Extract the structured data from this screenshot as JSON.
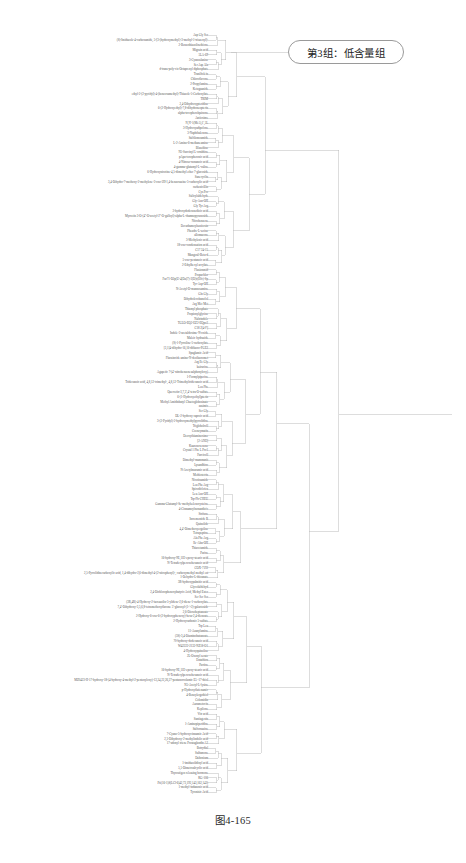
{
  "figure": {
    "caption": "图4-165",
    "background_color": "#ffffff",
    "line_color": "#b4b4b4",
    "label_color": "#545454"
  },
  "callout": {
    "label": "第3组：低含量组",
    "border_color": "#9a9a9a",
    "text_color": "#1c1c1c"
  },
  "chart_data": {
    "type": "dendrogram",
    "title": "图4-165",
    "orientation": "left-to-right",
    "leaf_label_position": "left",
    "grid": false,
    "legend": null,
    "xlabel": "",
    "ylabel": "",
    "annotations": [
      {
        "text": "第3组：低含量组",
        "target": "cluster-3",
        "shape": "rounded-rect"
      }
    ],
    "n_leaves": 170,
    "leaf_labels": [
      "Asp Gly Ser",
      "(S)-Imidazole-4-carboxamide, 5-[3-(hydroxymethyl)-3-methyl-1-triazenyl]-",
      "2-Benzothiazolinethione",
      "Migrain acid",
      "5LA-69",
      "3-Cyanoalanine",
      "Ser Asp Ala",
      "d-trans-poly-cis-Octaprenyl diphosphate",
      "Tranilfolein",
      "Chloroflavone",
      "2-Propylamine",
      "Ketoguanide",
      "ethyl-2-(2-pyridyl)-4-(benzoxamethyl)-Thiazole-5-Carboxylate",
      "TRIM",
      "2,4-Dihydroxypteridine",
      "6-(2-Hydroxyethyl)-7,8-dihydroneopterin",
      "alpha-tocopherolquinone",
      "Antioxime",
      "N,N'-1(Me5),1',5L",
      "3-Hydroxyadipolone",
      "3-Naphthalenone",
      "Sulfilomoamide",
      "L-2-Amino-6-methaneamine",
      "Blasoltine",
      "N5-Succinyl L-ornithine",
      "pApa-tocopheronic acid",
      "4-Nitroso-nonanoic acid",
      "4-gamma-glutamyl-L-valine",
      "6-Hydroxynicotine-4,5-dimethyl ether 7-glucoside",
      "Sanecyclin",
      "3,4-Dihydro-7-methoxy-2-methylene-3-oxo-2H-1,4-benzoxazine-5-carboxylic acid",
      "carbenicillin",
      "Cys Pro",
      "Salicylaldehyde",
      "Gly-Asn-OH",
      "Gly Tyr Arg",
      "3-hydroxydodecanedioic acid",
      "Myrcetin 3-O-(4''-O-acetyl-2''-O-galloyl)-alpha-L-rhamnopyranoside",
      "Nitrobenzene",
      "Decarbamoylsaxitoxin",
      "Pheadre-L-serine",
      "allomazone",
      "3-Methylenic acid",
      "18-oxo-condensation acid",
      "C17 24-15",
      "Mangosil-Beta-d",
      "5-oxo-pentanoic acid",
      "2-Ethylhexyl acrylate",
      "Flusionmid",
      "Propachlor",
      "Fur71-D2p(U-4[Da]7)-3[D]r(E0c)-Sp",
      "Tyr-Asp-OH",
      "N-Acetyl-D-mannosamine",
      "Gln Gly",
      "Dihydrolevobunolol",
      "Arg Met Met",
      "Thiamyl phosphate",
      "Propionylglycine",
      "Naltrindole",
      "TGLO-EQ2-EZ2-EQpo2",
      "C18 2[4-F]",
      "Indole-3-acetaldoxime-N-oxide",
      "Maleic hydrazide",
      "(S)-1-Pyrroline-5-carboxylate",
      "[3,1]4-dihydro-16,16-difluoro-PGE2",
      "Spaglumic Acid",
      "Flucaincide amino-N-desfluoromet",
      "Arg Ile Gly",
      "kairucine",
      "Agapetic 7-(4'-nitrobenzenesulphonyloxy)",
      "1-Formylpiperine",
      "Tridecanoic acid, 4,8,12-trimethyl-, 4,8,12-Trimethyltridecanoic acid",
      "Leu Phe",
      "Quercetin-3,7,3',4'-tetra-O-sulfate",
      "6-(1-Hydroxyethyl)pterin",
      "Methyl Amidinbutyl Chaetoglobosinate",
      "zusimic",
      "Ser Gly",
      "DL-2-hydroxy caproic acid",
      "3-(2-Pyridyl)-2-hydroxymethylpyrrolidine",
      "Trigloholroll",
      "Coenzymatin",
      "Deoxythiaminoxime",
      "[2-ANE]",
      "Kaurenoxenone",
      "Crystal 1 Phe L Pro1",
      "Furcicoll",
      "Dimethyl-mammanit",
      "Lysandhinc",
      "N-Acetylmuramic acid",
      "Methiotetrin",
      "Nicotinamide",
      "Leu Phe Arg",
      "Spirodiclofen",
      "Leu Asn-OH",
      "Trp-Ph-CHEU",
      "Gamma-Glutamyl-Se-methylselenocysteine",
      "4-Cinnamoylnonandioic",
      "Strifane",
      "Incrementide B",
      "Quinolide",
      "4,4'-Dimethoxyergoline",
      "Tetrapeptine",
      "Ala Phe Arg",
      "Ile-Abu-OH",
      "Thiacetamide",
      "Parine",
      "16-hydroxy-9E,11E-epoxy-stearic acid",
      "N-Tetradecylperoxohexanoic acid",
      "COX-7192",
      "2,5-Pyrrolidinecarboxylic acid, 1,4-dihydro-2,6-dimethyl-4-(2-nitrophenyl)-, carboxymethyl methyl est",
      "1-Dehydro-L-thioanate",
      "3R-hydroxypalmitic acid",
      "Glycolaldehyd",
      "2,4-Dichlorophenoxybutyric Acid, Methyl Ester",
      "Ser Ser Ser",
      "(3R,4R)-4-Hydroxy-2-isoxazolin-5-ylidene-2,6-diene-1-carboxylate",
      "7,4'-Dihydroxy-3,5,6,8-tetramethoxyflavone 5'-glucosyl-(1->2)-galactoside",
      "2,6-Dioxoheptanoate",
      "2-Hydroxy-6-oxo-6-(2-hydroxyphenoxy)-hexa-2,4-dienoate",
      "2-Hydroxycarbonic 5-sulfate",
      "Trp Leu",
      "11-Azanylamine",
      "(3S)-3,4-Diaminobutanoate",
      "70-hydroxy-dodecanoic acid",
      "W42222-2132-NZ18-O1",
      "4-Hydroxyquinoline",
      "2L-Oxonyl serate",
      "Entathion",
      "Pactine",
      "16-hydroxy-9E,11E-epoxy-stearic acid",
      "N-Tetradecylperoxohexanoic acid",
      "MZ0423-H-17-hydroxy-18-(4-hydroxy-4-methyl-2-pentenyloxy)-13,24,22,26,27-pentanorcolamic E5 -17-thiol",
      "N5-Acetyl-L-lysine",
      "p-Hydroxyflufenamic",
      "4-Benzylergothiol",
      "Colomidin",
      "Aurametocin",
      "Keplione",
      "Vitr acid",
      "Santiagenin",
      "1-Aminopiperidine",
      "Sulfornazine",
      "7-Cyano-5-hydroxycinnamic Acid",
      "2,3-Dihydroxy-2-methylindolic acid",
      "17-adonyl triene Prostaglandin A2",
      "Botrydial",
      "Sulfamone",
      "Daltonium",
      "1-imidazolidinyl acid",
      "5,5-Dimetroalcyclic acid",
      "Thyrostigen releasing hormone",
      "KG-106",
      "Pti(16-1)S(LCl-6)42,73,192,143,162,143)",
      "1-methyl-indanonic acid",
      "Tyronisic Acid"
    ],
    "merge_structure": {
      "description": "Left-to-right dendrogram; leaf ticks at x=208 merge through nested vertical spines at increasing x into a single root at x=440",
      "spine_x_positions": [
        212,
        218,
        226,
        236,
        252,
        292,
        408,
        440
      ],
      "root_x": 440,
      "root_y": 430,
      "cluster_3": {
        "label": "第3组：低含量组",
        "spine_x": 292,
        "y_top": 52,
        "y_bottom": 800
      }
    }
  }
}
